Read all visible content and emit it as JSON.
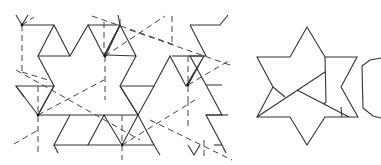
{
  "figure": {
    "colors": {
      "line": "#333333",
      "dash": "#444444",
      "background": "#ffffff"
    },
    "panels": [
      {
        "id": "tessellation",
        "label": "",
        "kind": "tiling with solid edges and dashed triangle overlay"
      },
      {
        "id": "hexagram-dissection",
        "label": "",
        "kind": "six-pointed star cut into pieces"
      },
      {
        "id": "partial-shape",
        "label": "",
        "kind": "partially visible hexagonal piece (cropped)"
      }
    ]
  }
}
